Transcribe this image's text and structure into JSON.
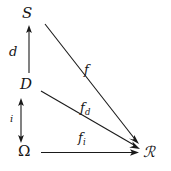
{
  "diagram": {
    "background_color": "#ffffff",
    "ink_color": "#1a1a1a",
    "nodes": [
      {
        "id": "S",
        "label": "S",
        "x": 26,
        "y": 14
      },
      {
        "id": "D",
        "label": "D",
        "x": 25,
        "y": 85
      },
      {
        "id": "Omega",
        "label": "Ω",
        "x": 25,
        "y": 152
      },
      {
        "id": "R",
        "label": "ℛ",
        "x": 150,
        "y": 153
      }
    ],
    "edges": [
      {
        "id": "d",
        "label": "d",
        "label_base": "d",
        "label_sub": "",
        "from": "D",
        "to": "S",
        "kind": "vertical",
        "arrowheads": "single-up"
      },
      {
        "id": "i",
        "label": "i",
        "label_base": "i",
        "label_sub": "",
        "from": "Omega",
        "to": "D",
        "kind": "vertical",
        "arrowheads": "double"
      },
      {
        "id": "f",
        "label": "f",
        "label_base": "f",
        "label_sub": "",
        "from": "S",
        "to": "R",
        "kind": "diagonal",
        "arrowheads": "single-right"
      },
      {
        "id": "f_d",
        "label": "f_d",
        "label_base": "f",
        "label_sub": "d",
        "from": "D",
        "to": "R",
        "kind": "diagonal",
        "arrowheads": "single-right"
      },
      {
        "id": "f_i",
        "label": "f_i",
        "label_base": "f",
        "label_sub": "i",
        "from": "Omega",
        "to": "R",
        "kind": "horizontal",
        "arrowheads": "single-right"
      }
    ]
  }
}
